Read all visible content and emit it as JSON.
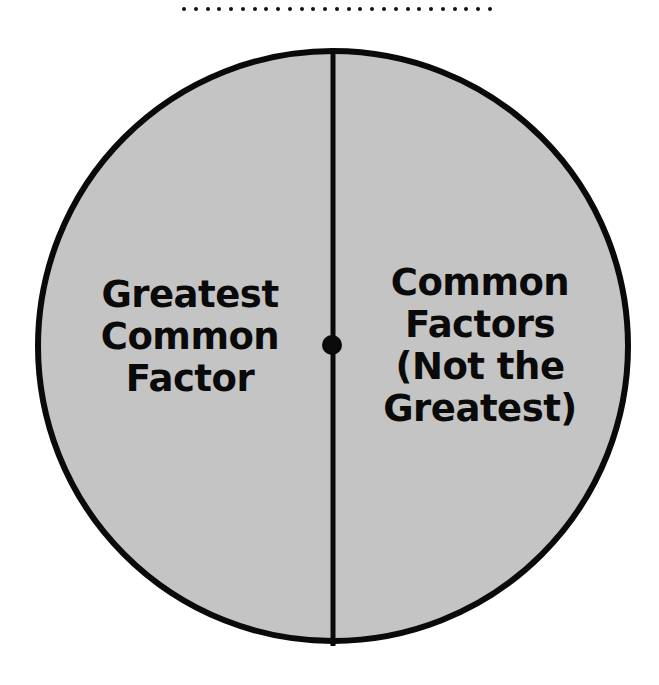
{
  "diagram": {
    "type": "circle-split-two-regions",
    "colors": {
      "fill": "#c4c4c4",
      "outline": "#0a0a0a",
      "text": "#0a0a0a",
      "background": "#ffffff"
    },
    "regions": [
      {
        "side": "left",
        "label_lines": [
          "Greatest",
          "Common",
          "Factor"
        ]
      },
      {
        "side": "right",
        "label_lines": [
          "Common",
          "Factors",
          "(Not the",
          "Greatest)"
        ]
      }
    ]
  }
}
